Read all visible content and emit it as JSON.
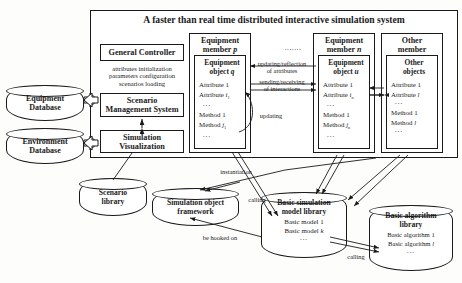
{
  "title": "A faster than real time distributed interactive simulation system",
  "left_databases": [
    {
      "line1": "Equipment",
      "line2": "Database"
    },
    {
      "line1": "Environment",
      "line2": "Database"
    }
  ],
  "control_column": {
    "general_controller": "General Controller",
    "controller_note_l1": "attributes initialization",
    "controller_note_l2": "parameters configuration",
    "controller_note_l3": "scenarios loading",
    "scenario_mgmt_l1": "Scenario",
    "scenario_mgmt_l2": "Management System",
    "simulation_vis_l1": "Simulation",
    "simulation_vis_l2": "Visualization"
  },
  "members": [
    {
      "title_l1": "Equipment",
      "title_l2": "member p",
      "object_l1": "Equipment",
      "object_l2": "object q",
      "attributes": [
        "Attribute 1",
        "Attribute i1",
        "..."
      ],
      "methods": [
        "Method 1",
        "Method j1",
        "..."
      ]
    },
    {
      "title_l1": "Equipment",
      "title_l2": "member n",
      "object_l1": "Equipment",
      "object_l2": "object u",
      "attributes": [
        "Attribute 1",
        "Attribute in",
        "..."
      ],
      "methods": [
        "Method 1",
        "Method jn",
        "..."
      ]
    },
    {
      "title_l1": "Other",
      "title_l2": "member",
      "object_l1": "Other",
      "object_l2": "objects",
      "attributes": [
        "Attribute 1",
        "Attribute l",
        "..."
      ],
      "methods": [
        "Method 1",
        "Method l",
        "..."
      ]
    }
  ],
  "ellipsis_between_members": ".......",
  "edge_labels": {
    "updating_reflection_l1": "updating/reflection",
    "updating_reflection_l2": "of attributes",
    "sending_receiving_l1": "sending/receiving",
    "sending_receiving_l2": "of interactions",
    "updating": "updating",
    "instantiation": "instantiation",
    "calling_upper": "calling",
    "be_hooked_on": "be hooked on",
    "calling_lower": "calling"
  },
  "bottom_stores": {
    "scenario_library_l1": "Scenario",
    "scenario_library_l2": "library",
    "sim_object_framework_l1": "Simulation object",
    "sim_object_framework_l2": "framework",
    "basic_model_library_l1": "Basic simulation",
    "basic_model_library_l2": "model library",
    "basic_models": [
      "Basic model 1",
      "Basic model k",
      "..."
    ],
    "basic_algorithm_library_l1": "Basic algorithm",
    "basic_algorithm_library_l2": "library",
    "basic_algorithms": [
      "Basic algorithm 1",
      "Basic algorithm l",
      "..."
    ]
  },
  "colors": {
    "stroke": "#1a1a1a",
    "fill": "#ffffff",
    "background": "#fdfdfc"
  }
}
